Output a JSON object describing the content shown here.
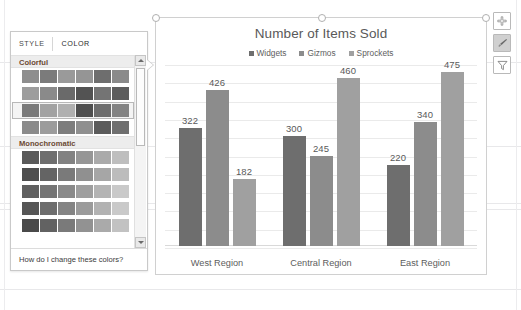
{
  "format_pane": {
    "tabs": [
      {
        "label": "STYLE",
        "active": false
      },
      {
        "label": "COLOR",
        "active": true
      }
    ],
    "groups": [
      {
        "title": "Colorful",
        "rows": [
          {
            "selected": false,
            "colors": [
              "#8e8e8e",
              "#7b7b7b",
              "#9a9a9a",
              "#959595",
              "#6e6e6e",
              "#8a8a8a"
            ]
          },
          {
            "selected": false,
            "colors": [
              "#9d9d9d",
              "#8a8a8a",
              "#6a6a6a",
              "#535353",
              "#747474",
              "#5d5d5d"
            ]
          },
          {
            "selected": true,
            "colors": [
              "#7a7a7a",
              "#a2a2a2",
              "#b0b0b0",
              "#4f4f4f",
              "#6d6d6d",
              "#838383"
            ]
          },
          {
            "selected": false,
            "colors": [
              "#8b8b8b",
              "#9c9c9c",
              "#7d7d7d",
              "#8f8f8f",
              "#5b5b5b",
              "#6f6f6f"
            ]
          }
        ]
      },
      {
        "title": "Monochromatic",
        "rows": [
          {
            "selected": false,
            "colors": [
              "#5a5a5a",
              "#6e6e6e",
              "#828282",
              "#969696",
              "#aaaaaa",
              "#bebebe"
            ]
          },
          {
            "selected": false,
            "colors": [
              "#4e4e4e",
              "#646464",
              "#7a7a7a",
              "#909090",
              "#a6a6a6",
              "#bcbcbc"
            ]
          },
          {
            "selected": false,
            "colors": [
              "#606060",
              "#757575",
              "#8a8a8a",
              "#9f9f9f",
              "#b4b4b4",
              "#c9c9c9"
            ]
          },
          {
            "selected": false,
            "colors": [
              "#565656",
              "#6d6d6d",
              "#848484",
              "#9b9b9b",
              "#b2b2b2",
              "#c9c9c9"
            ]
          },
          {
            "selected": false,
            "colors": [
              "#4a4a4a",
              "#626262",
              "#7a7a7a",
              "#929292",
              "#aaaaaa",
              "#c2c2c2"
            ]
          }
        ]
      }
    ],
    "scrollbar": {
      "up_arrow_icon": "scroll-up-arrow-icon",
      "down_arrow_icon": "scroll-down-arrow-icon"
    },
    "footer_link": "How do I change these colors?"
  },
  "chart_buttons": [
    {
      "name": "chart-elements-button",
      "icon": "plus-icon",
      "active": false
    },
    {
      "name": "chart-styles-button",
      "icon": "paintbrush-icon",
      "active": true
    },
    {
      "name": "chart-filters-button",
      "icon": "funnel-filter-icon",
      "active": false
    }
  ],
  "chart_data": {
    "type": "bar",
    "title": "Number of Items Sold",
    "xlabel": "",
    "ylabel": "",
    "ylim": [
      0,
      500
    ],
    "grid": true,
    "legend_position": "top",
    "categories": [
      "West Region",
      "Central Region",
      "East Region"
    ],
    "series": [
      {
        "name": "Widgets",
        "color": "#6e6e6e",
        "values": [
          322,
          300,
          220
        ]
      },
      {
        "name": "Gizmos",
        "color": "#8c8c8c",
        "values": [
          426,
          245,
          340
        ]
      },
      {
        "name": "Sprockets",
        "color": "#a0a0a0",
        "values": [
          182,
          460,
          475
        ]
      }
    ],
    "data_labels": true
  }
}
